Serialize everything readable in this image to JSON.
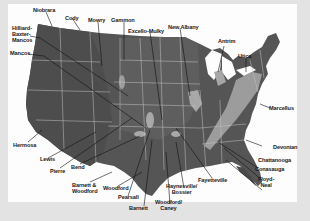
{
  "map": {
    "subject": "U.S. shale gas plays",
    "colors": {
      "frame": "#e3e3e3",
      "panel": "#fdfdfd",
      "land_dark": "#4a4a4a",
      "land_mid": "#6a6a6a",
      "west_terrain": "#5a5a5a",
      "shale_basin": "#a8a8a8",
      "appalachian": "#9a9a9a",
      "state_lines": "#c8c8c8",
      "leader_lines": "#111111",
      "label_text": "#1a1a1a"
    },
    "labels": {
      "niobrara": "Niobrara",
      "cody": "Cody",
      "mowry": "Mowry",
      "gammon": "Gammon",
      "excello_mulky": "Excello-Mulky",
      "new_albany": "New Albany",
      "antrim": "Antrim",
      "utica": "Utica",
      "hilliard_1": "Hilliard-",
      "hilliard_2": "Baxter-",
      "hilliard_3": "Mancos",
      "mancos": "Mancos",
      "marcellus": "Marcellus",
      "devonian": "Devonian",
      "hermosa": "Hermosa",
      "lewis": "Lewis",
      "pierre": "Pierre",
      "bend": "Bend",
      "barnett_woodford_1": "Barnett &",
      "barnett_woodford_2": "Woodford",
      "woodford": "Woodford",
      "pearsall": "Pearsall",
      "barnett": "Barnett",
      "woodford_caney_1": "Woodford/",
      "woodford_caney_2": "Caney",
      "haynesville_1": "Haynesville/",
      "haynesville_2": "Bossier",
      "fayetteville": "Fayetteville",
      "chattanooga": "Chattanooga",
      "conasauga": "Conasauga",
      "floyd_neal_1": "Floyd-",
      "floyd_neal_2": "Neal"
    }
  }
}
